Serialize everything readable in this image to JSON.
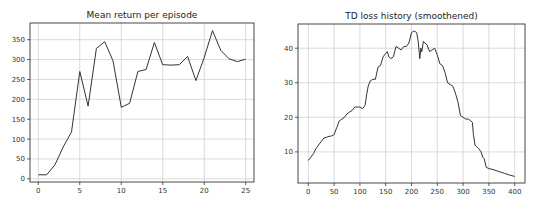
{
  "chart_data": [
    {
      "type": "line",
      "title": "Mean return per episode",
      "xlabel": "",
      "ylabel": "",
      "xlim": [
        -1,
        26
      ],
      "ylim": [
        -8,
        392
      ],
      "xticks": [
        0,
        5,
        10,
        15,
        20,
        25
      ],
      "yticks": [
        0,
        50,
        100,
        150,
        200,
        250,
        300,
        350
      ],
      "grid": true,
      "legend": null,
      "x": [
        0,
        1,
        2,
        3,
        4,
        5,
        6,
        7,
        8,
        9,
        10,
        11,
        12,
        13,
        14,
        15,
        16,
        17,
        18,
        19,
        20,
        21,
        22,
        23,
        24,
        25
      ],
      "series": [
        {
          "name": "mean_return",
          "values": [
            10,
            10,
            35,
            80,
            118,
            270,
            183,
            328,
            345,
            297,
            180,
            190,
            270,
            275,
            343,
            287,
            286,
            287,
            308,
            247,
            305,
            373,
            323,
            302,
            295,
            301
          ]
        }
      ]
    },
    {
      "type": "line",
      "title": "TD loss history (smoothened)",
      "xlabel": "",
      "ylabel": "",
      "xlim": [
        -20,
        420
      ],
      "ylim": [
        1,
        47
      ],
      "xticks": [
        0,
        50,
        100,
        150,
        200,
        250,
        300,
        350,
        400
      ],
      "yticks": [
        10,
        20,
        30,
        40
      ],
      "grid": true,
      "legend": null,
      "x": [
        0,
        5,
        10,
        15,
        20,
        25,
        30,
        35,
        40,
        45,
        50,
        55,
        60,
        65,
        70,
        75,
        80,
        85,
        90,
        95,
        100,
        105,
        110,
        113,
        116,
        120,
        125,
        130,
        135,
        140,
        145,
        150,
        153,
        156,
        160,
        165,
        170,
        175,
        180,
        185,
        190,
        195,
        200,
        205,
        210,
        213,
        216,
        218,
        220,
        223,
        226,
        230,
        235,
        240,
        245,
        250,
        255,
        260,
        265,
        270,
        275,
        280,
        285,
        290,
        295,
        300,
        305,
        310,
        315,
        318,
        320,
        323,
        326,
        330,
        335,
        338,
        341,
        345,
        350,
        360,
        370,
        380,
        390,
        400
      ],
      "series": [
        {
          "name": "td_loss",
          "values": [
            7.5,
            8.5,
            9.5,
            11,
            12,
            13,
            14,
            14.2,
            14.5,
            14.6,
            15,
            17,
            19,
            19.5,
            20,
            21,
            21.5,
            22,
            23,
            23,
            23,
            22.5,
            23.5,
            26.5,
            29,
            30.5,
            31,
            31,
            34.5,
            35,
            37.5,
            38.5,
            39,
            37.5,
            37,
            37.5,
            40.5,
            40,
            39.5,
            40.5,
            40.5,
            41.5,
            44.5,
            45,
            44.5,
            42,
            37,
            40,
            39,
            42,
            41.5,
            41,
            39,
            39.5,
            40,
            38,
            35.5,
            35,
            33,
            30,
            29.5,
            29,
            27,
            24.5,
            20.5,
            20,
            19.5,
            19.5,
            19,
            18.5,
            15,
            12,
            11.5,
            11,
            10,
            8.5,
            8,
            5.5,
            5.2,
            4.8,
            4.3,
            3.8,
            3.3,
            2.9
          ]
        }
      ]
    }
  ],
  "charts": [
    {
      "title": "Mean return per episode",
      "xticks": [
        "0",
        "5",
        "10",
        "15",
        "20",
        "25"
      ],
      "yticks": [
        "0",
        "50",
        "100",
        "150",
        "200",
        "250",
        "300",
        "350"
      ]
    },
    {
      "title": "TD loss history (smoothened)",
      "xticks": [
        "0",
        "50",
        "100",
        "150",
        "200",
        "250",
        "300",
        "350",
        "400"
      ],
      "yticks": [
        "10",
        "20",
        "30",
        "40"
      ]
    }
  ],
  "colors": {
    "line": "#333333",
    "grid": "#d0d0d0",
    "spine": "#333333"
  }
}
